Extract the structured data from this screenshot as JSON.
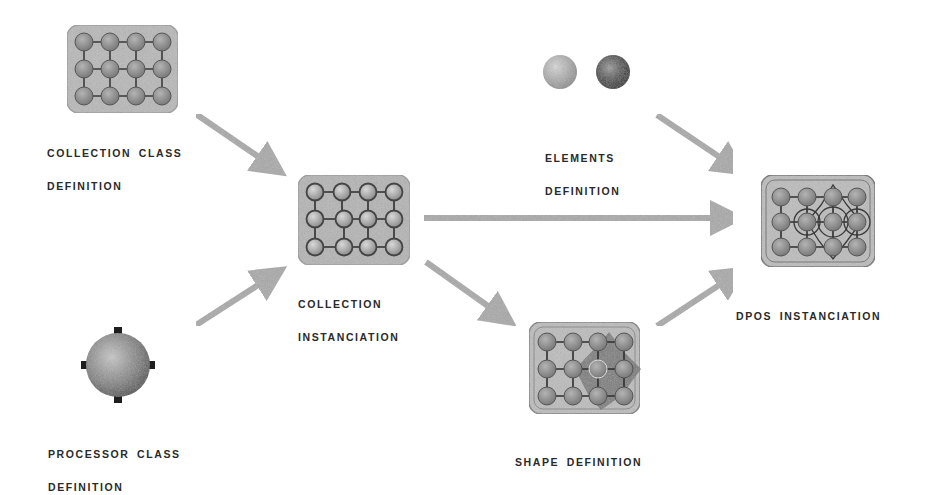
{
  "diagram": {
    "nodes": [
      {
        "id": "collection-class",
        "label_lines": [
          "COLLECTION CLASS",
          "DEFINITION"
        ],
        "kind": "grid-box"
      },
      {
        "id": "collection-instanciation",
        "label_lines": [
          "COLLECTION",
          "INSTANCIATION"
        ],
        "kind": "grid-box"
      },
      {
        "id": "processor-class",
        "label_lines": [
          "PROCESSOR CLASS",
          "DEFINITION"
        ],
        "kind": "sphere-with-ports"
      },
      {
        "id": "elements-definition",
        "label_lines": [
          "ELEMENTS",
          "DEFINITION"
        ],
        "kind": "two-spheres"
      },
      {
        "id": "shape-definition",
        "label_lines": [
          "SHAPE DEFINITION"
        ],
        "kind": "grid-box-with-shape"
      },
      {
        "id": "dpos-instanciation",
        "label_lines": [
          "DPOS INSTANCIATION"
        ],
        "kind": "grid-box-with-elements"
      }
    ],
    "edges": [
      {
        "from": "collection-class",
        "to": "collection-instanciation"
      },
      {
        "from": "processor-class",
        "to": "collection-instanciation"
      },
      {
        "from": "collection-instanciation",
        "to": "dpos-instanciation"
      },
      {
        "from": "collection-instanciation",
        "to": "shape-definition"
      },
      {
        "from": "shape-definition",
        "to": "dpos-instanciation"
      },
      {
        "from": "elements-definition",
        "to": "dpos-instanciation"
      }
    ],
    "colors": {
      "box_fill": "#b8b8b8",
      "box_border": "#8a8a8a",
      "node_fill": "#8c8c8c",
      "node_stroke": "#505050",
      "arrow": "#a8a8a8",
      "text": "#2a2a2a",
      "shape_fill": "#6e6e6e",
      "light_sphere": "#b0b0b0",
      "dark_sphere": "#3a3a3a"
    }
  }
}
